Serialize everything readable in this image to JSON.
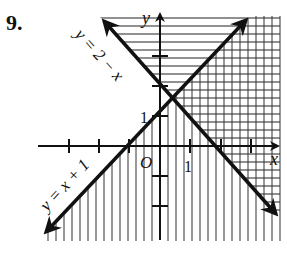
{
  "problem": {
    "number": "9."
  },
  "axes": {
    "x_label": "x",
    "y_label": "y",
    "origin_label": "O",
    "x_tick_label": "1",
    "y_tick_label": "1"
  },
  "lines": [
    {
      "name": "line-y-equals-2-minus-x",
      "label": "y = 2 − x",
      "slope": -1,
      "intercept": 2
    },
    {
      "name": "line-y-equals-x-plus-1",
      "label": "y = x + 1",
      "slope": 1,
      "intercept": 1
    }
  ],
  "shading": {
    "horizontal_hatch": "y ≥ 2 − x",
    "vertical_hatch": "y ≤ x + 1",
    "solution_region": "crosshatched (y ≥ 2 − x and y ≤ x + 1)"
  },
  "intersection": {
    "x": 0.5,
    "y": 1.5
  },
  "colors": {
    "ink": "#111111",
    "background": "#ffffff"
  }
}
